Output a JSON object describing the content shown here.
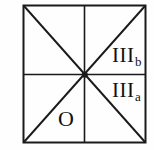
{
  "figure": {
    "type": "square-sector-diagram",
    "background_color": "#fefefe",
    "line_color": "#1a1a1a",
    "border": {
      "left": 23,
      "top": 5,
      "right": 146,
      "bottom": 143,
      "stroke_width": 2
    },
    "center": {
      "x": 85,
      "y": 75
    },
    "lines": [
      {
        "name": "outer-square",
        "kind": "rect"
      },
      {
        "name": "vertical-midline",
        "kind": "line"
      },
      {
        "name": "horizontal-midline",
        "kind": "line"
      },
      {
        "name": "diagonal-tl-br",
        "kind": "line"
      },
      {
        "name": "diagonal-tr-bl",
        "kind": "line"
      }
    ],
    "center_dot": {
      "radius": 3
    },
    "labels": [
      {
        "id": "IIIb",
        "base": "III",
        "sub": "b",
        "sector": "upper-right-lower-triangle"
      },
      {
        "id": "IIIa",
        "base": "III",
        "sub": "a",
        "sector": "lower-right-upper-triangle"
      },
      {
        "id": "O",
        "base": "O",
        "sub": "",
        "sector": "lower-left-right-triangle"
      }
    ]
  }
}
